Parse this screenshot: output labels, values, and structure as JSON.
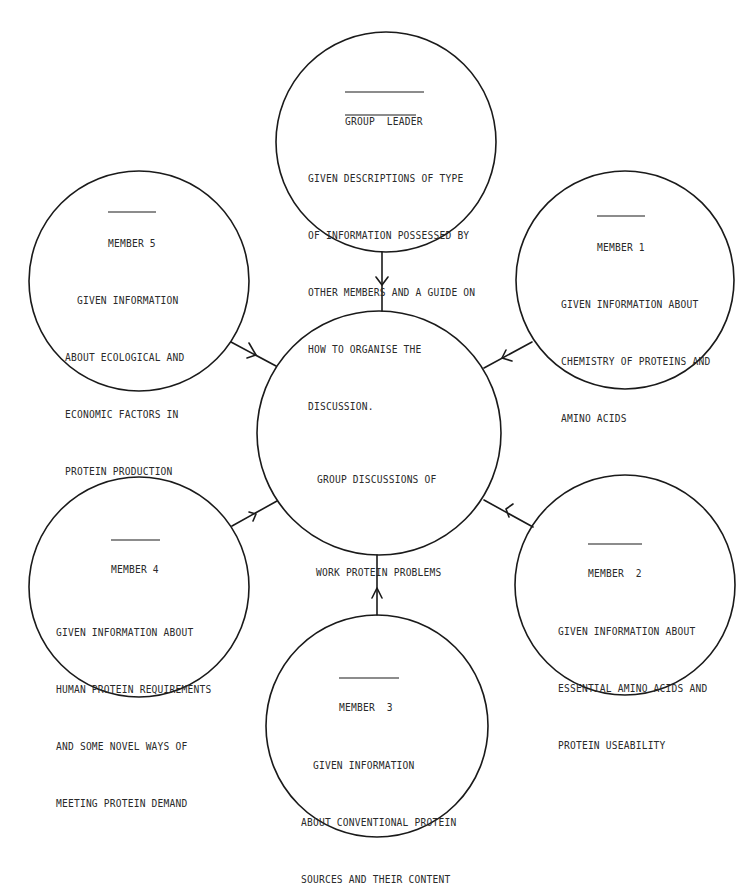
{
  "diagram": {
    "type": "hub-and-spoke",
    "stroke_color": "#1a1a1a",
    "background": "#ffffff"
  },
  "center": {
    "lines": [
      "GROUP DISCUSSIONS OF",
      "WORK PROTEIN PROBLEMS"
    ]
  },
  "group_leader": {
    "title": "GROUP  LEADER",
    "line1_prefix": "GIVEN ",
    "line1_underlined": "DESCRIPTIONS",
    "line1_suffix": " OF TYPE",
    "lines": [
      "OF INFORMATION POSSESSED BY",
      "OTHER MEMBERS AND A GUIDE ON",
      "HOW TO ORGANISE THE",
      "DISCUSSION."
    ]
  },
  "member1": {
    "title": "MEMBER 1",
    "lines": [
      "GIVEN INFORMATION ABOUT",
      "CHEMISTRY OF PROTEINS AND",
      "AMINO ACIDS"
    ]
  },
  "member2": {
    "title": "MEMBER  2",
    "lines": [
      "GIVEN INFORMATION ABOUT",
      "ESSENTIAL AMINO ACIDS AND",
      "PROTEIN USEABILITY"
    ]
  },
  "member3": {
    "title": "MEMBER  3",
    "lines": [
      "  GIVEN INFORMATION",
      "ABOUT CONVENTIONAL PROTEIN",
      "SOURCES AND THEIR CONTENT"
    ]
  },
  "member4": {
    "title": "MEMBER 4",
    "lines": [
      "GIVEN INFORMATION ABOUT",
      "HUMAN PROTEIN REQUIREMENTS",
      "AND SOME NOVEL WAYS OF",
      "MEETING PROTEIN DEMAND"
    ]
  },
  "member5": {
    "title": "MEMBER 5",
    "lines": [
      "  GIVEN INFORMATION",
      "ABOUT ECOLOGICAL AND",
      "ECONOMIC FACTORS IN",
      "PROTEIN PRODUCTION"
    ]
  },
  "edges": [
    {
      "from": "group_leader",
      "to": "center",
      "arrow": "into-center"
    },
    {
      "from": "member1",
      "to": "center",
      "arrow": "into-center"
    },
    {
      "from": "member2",
      "to": "center",
      "arrow": "into-center"
    },
    {
      "from": "member3",
      "to": "center",
      "arrow": "into-center"
    },
    {
      "from": "member4",
      "to": "center",
      "arrow": "into-center"
    },
    {
      "from": "member5",
      "to": "center",
      "arrow": "into-center"
    }
  ]
}
